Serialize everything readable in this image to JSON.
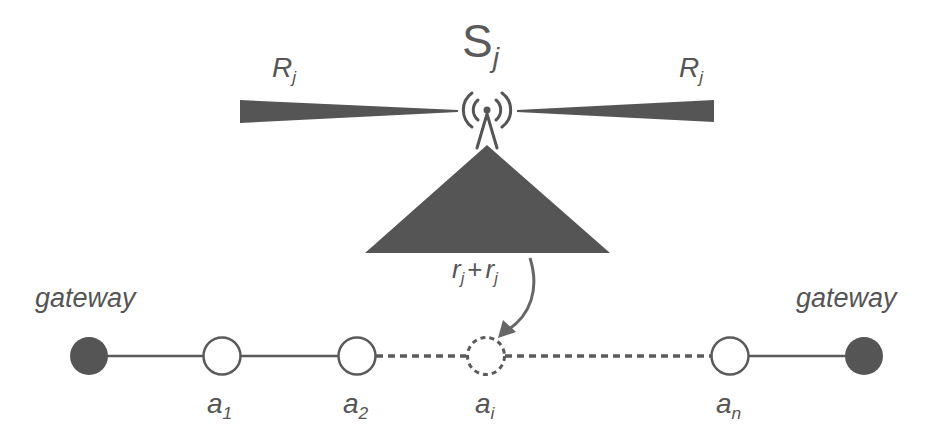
{
  "diagram": {
    "sensor": {
      "symbol": "S",
      "subscript": "j"
    },
    "range_left": {
      "symbol": "R",
      "subscript": "j"
    },
    "range_right": {
      "symbol": "R",
      "subscript": "j"
    },
    "coverage": {
      "part1": "r",
      "sub1": "j",
      "op": "+",
      "part2": "r",
      "sub2": "j"
    },
    "gateway_left": "gateway",
    "gateway_right": "gateway",
    "nodes": [
      {
        "symbol": "a",
        "subscript": "1",
        "style": "solid"
      },
      {
        "symbol": "a",
        "subscript": "2",
        "style": "solid"
      },
      {
        "symbol": "a",
        "subscript": "i",
        "style": "dashed"
      },
      {
        "symbol": "a",
        "subscript": "n",
        "style": "solid"
      }
    ],
    "colors": {
      "fill": "#555555",
      "stroke": "#5a5a5a",
      "background": "#ffffff"
    }
  }
}
